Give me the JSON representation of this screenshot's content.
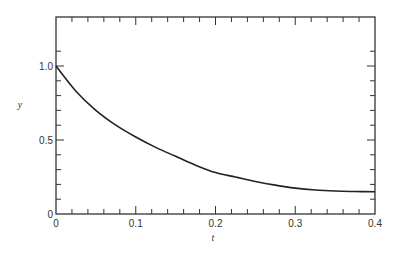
{
  "chart_data": {
    "type": "line",
    "title": "",
    "xlabel": "t",
    "ylabel": "y",
    "xlim": [
      0,
      0.4
    ],
    "ylim": [
      0,
      1.2
    ],
    "grid": false,
    "legend": null,
    "x_ticks": [
      "0",
      "0.1",
      "0.2",
      "0.3",
      "0.4"
    ],
    "y_ticks": [
      "0",
      "0.5",
      "1.0"
    ],
    "series": [
      {
        "name": "y(t)",
        "x": [
          0,
          0.025,
          0.05,
          0.075,
          0.1,
          0.125,
          0.15,
          0.175,
          0.2,
          0.225,
          0.25,
          0.275,
          0.3,
          0.325,
          0.35,
          0.375,
          0.4
        ],
        "values": [
          1.0,
          0.83,
          0.7,
          0.6,
          0.52,
          0.45,
          0.39,
          0.33,
          0.28,
          0.25,
          0.22,
          0.195,
          0.175,
          0.162,
          0.155,
          0.152,
          0.15
        ]
      }
    ]
  }
}
